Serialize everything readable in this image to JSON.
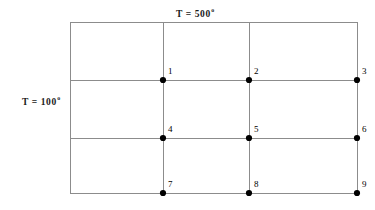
{
  "figure": {
    "type": "finite-difference-grid",
    "background_color": "#ffffff",
    "line_color": "#8c8c8c",
    "border_color": "#8c8c8c",
    "node_color": "#000000",
    "width": 375,
    "height": 210
  },
  "boundary_conditions": {
    "top": {
      "text": "T = 500",
      "degree": "o",
      "value": 500,
      "unit": "degrees",
      "position": "top"
    },
    "left": {
      "text": "T = 100",
      "degree": "o",
      "value": 100,
      "unit": "degrees",
      "position": "left"
    }
  },
  "grid": {
    "plate": {
      "x1": 70,
      "y1": 22,
      "x2": 357,
      "y2": 193
    },
    "vertical_lines_x": [
      163,
      249
    ],
    "horizontal_lines_y": [
      80,
      138
    ],
    "columns": 3,
    "rows": 3
  },
  "nodes": [
    {
      "label": "1",
      "x": 163,
      "y": 80
    },
    {
      "label": "2",
      "x": 249,
      "y": 80
    },
    {
      "label": "3",
      "x": 357,
      "y": 80
    },
    {
      "label": "4",
      "x": 163,
      "y": 138
    },
    {
      "label": "5",
      "x": 249,
      "y": 138
    },
    {
      "label": "6",
      "x": 357,
      "y": 138
    },
    {
      "label": "7",
      "x": 163,
      "y": 193
    },
    {
      "label": "8",
      "x": 249,
      "y": 193
    },
    {
      "label": "9",
      "x": 357,
      "y": 193
    }
  ]
}
